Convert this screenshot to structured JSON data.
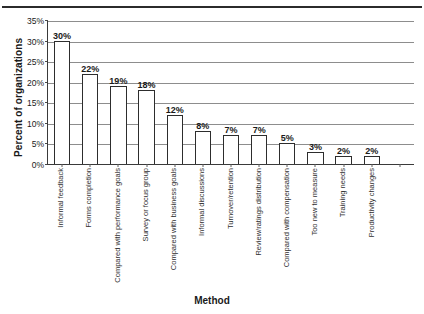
{
  "chart_data": {
    "type": "bar",
    "title": "",
    "xlabel": "Method",
    "ylabel": "Percent of organizations",
    "ylim": [
      0,
      35
    ],
    "ytick_labels": [
      "0%",
      "5%",
      "10%",
      "15%",
      "20%",
      "25%",
      "30%",
      "35%"
    ],
    "ytick_values": [
      0,
      5,
      10,
      15,
      20,
      25,
      30,
      35
    ],
    "grid": "horizontal",
    "legend": "none",
    "bar_style": "white fill, black outline",
    "categories": [
      "Informal feedback",
      "Forms completion",
      "Compared with performance goals",
      "Survey or focus group",
      "Compared with business goals",
      "Informal discussions",
      "Turnover/retention",
      "Review/ratings distribution",
      "Compared with compensation",
      "Too new to measure",
      "Training needs",
      "Productivity changes"
    ],
    "values": [
      30,
      22,
      19,
      18,
      12,
      8,
      7,
      7,
      5,
      3,
      2,
      2
    ],
    "data_labels": [
      "30%",
      "22%",
      "19%",
      "18%",
      "12%",
      "8%",
      "7%",
      "7%",
      "5%",
      "3%",
      "2%",
      "2%"
    ]
  }
}
